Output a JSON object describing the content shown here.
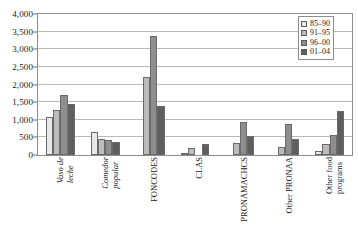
{
  "chart_data": {
    "type": "bar",
    "title": "",
    "subtitle": "",
    "xlabel": "",
    "ylabel": "",
    "ylim": [
      0,
      4000
    ],
    "ytick_labels": [
      "0",
      "500",
      "1,000",
      "1,500",
      "2,000",
      "2,500",
      "3,000",
      "3,500",
      "4,000"
    ],
    "ytick_values": [
      0,
      500,
      1000,
      1500,
      2000,
      2500,
      3000,
      3500,
      4000
    ],
    "grid": "horizontal",
    "legend_position": "top-right",
    "categories": [
      "Vaso de leche",
      "Comedor popular",
      "FONCODES",
      "CLAS",
      "PRONAMACHCS",
      "Other PRONAA",
      "Other food programs"
    ],
    "category_lines": [
      [
        "Vaso de",
        "leche"
      ],
      [
        "Comedor",
        "popular"
      ],
      [
        "FONCODES"
      ],
      [
        "CLAS"
      ],
      [
        "PRONAMACHCS"
      ],
      [
        "Other PRONAA"
      ],
      [
        "Other food",
        "programs"
      ]
    ],
    "category_italic": [
      true,
      true,
      false,
      false,
      false,
      false,
      false
    ],
    "series": [
      {
        "name": "85–90",
        "color": "#e8e8e6",
        "values": [
          1070,
          640,
          0,
          60,
          0,
          0,
          100
        ]
      },
      {
        "name": "91–95",
        "color": "#bcbcbc",
        "values": [
          1270,
          460,
          2220,
          190,
          350,
          220,
          300
        ]
      },
      {
        "name": "96–00",
        "color": "#8e8e8e",
        "values": [
          1690,
          420,
          3380,
          0,
          930,
          870,
          560
        ]
      },
      {
        "name": "01–04",
        "color": "#5e5e5e",
        "values": [
          1460,
          370,
          1390,
          320,
          530,
          450,
          1240
        ]
      }
    ]
  },
  "legend": {
    "items": [
      {
        "label": "85–90"
      },
      {
        "label": "91–95"
      },
      {
        "label": "96–00"
      },
      {
        "label": "01–04"
      }
    ]
  },
  "colors": {
    "series_1": "#e8e8e6",
    "series_2": "#bcbcbc",
    "series_3": "#8e8e8e",
    "series_4": "#5e5e5e",
    "grid": "#b9b9b9",
    "frame": "#8d8d8d",
    "text": "#1a1a1a"
  }
}
